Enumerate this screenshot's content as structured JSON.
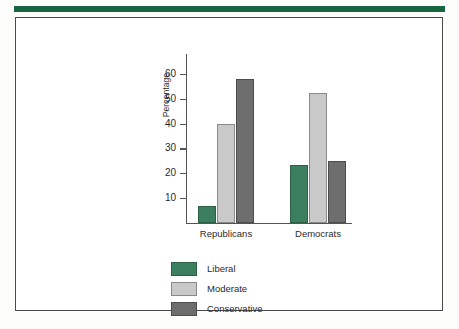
{
  "figure": {
    "accent_green": "#16663f",
    "frame_border": "#4a4a4a"
  },
  "chart_data": {
    "type": "bar",
    "title": "",
    "xlabel": "",
    "ylabel": "Percentage",
    "categories": [
      "Republicans",
      "Democrats"
    ],
    "series": [
      {
        "name": "Liberal",
        "color": "#3c7f5e",
        "values": [
          7,
          23.5
        ]
      },
      {
        "name": "Moderate",
        "color": "#c9c9c9",
        "values": [
          40,
          52.5
        ]
      },
      {
        "name": "Conservative",
        "color": "#6e6e6e",
        "values": [
          58,
          25
        ]
      }
    ],
    "ylim": [
      0,
      68
    ],
    "yticks": [
      10,
      20,
      30,
      40,
      50,
      60
    ],
    "ytick_labels": [
      "10",
      "20",
      "30",
      "40",
      "50",
      "60"
    ],
    "grid": false,
    "legend_position": "bottom-left"
  }
}
